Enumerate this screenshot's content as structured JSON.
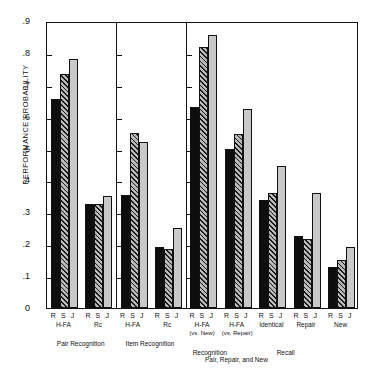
{
  "chart_data": {
    "type": "bar",
    "title": "",
    "xlabel": "Pair, Repair, and New",
    "ylabel": "PERFORMANCE PROBABILITY",
    "ylim": [
      0,
      0.9
    ],
    "yticks": [
      "0",
      ".1",
      ".2",
      ".3",
      ".4",
      ".5",
      ".6",
      ".7",
      ".8",
      ".9"
    ],
    "grid": false,
    "legend": "none",
    "series": [
      {
        "name": "R",
        "fill": "black"
      },
      {
        "name": "S",
        "fill": "hatched"
      },
      {
        "name": "J",
        "fill": "gray"
      }
    ],
    "panels": [
      {
        "title": "Pair Recognition",
        "groups": [
          {
            "label": "R S J",
            "sub1": "H-FA",
            "sub2": "",
            "values": [
              0.655,
              0.735,
              0.78
            ]
          },
          {
            "label": "R S J",
            "sub1": "Rc",
            "sub2": "",
            "values": [
              0.325,
              0.325,
              0.35
            ]
          }
        ]
      },
      {
        "title": "Item Recognition",
        "groups": [
          {
            "label": "R S J",
            "sub1": "H-FA",
            "sub2": "",
            "values": [
              0.355,
              0.55,
              0.52
            ]
          },
          {
            "label": "R S J",
            "sub1": "Rc",
            "sub2": "",
            "values": [
              0.19,
              0.185,
              0.25
            ]
          }
        ]
      },
      {
        "title": "Recognition",
        "title2": "Recall",
        "groups": [
          {
            "label": "R S J",
            "sub1": "H-FA",
            "sub2": "(vs. New)",
            "values": [
              0.63,
              0.82,
              0.855
            ]
          },
          {
            "label": "R S J",
            "sub1": "H-FA",
            "sub2": "(vs. Repair)",
            "values": [
              0.5,
              0.545,
              0.625
            ]
          },
          {
            "label": "R S J",
            "sub1": "Identical",
            "sub2": "",
            "values": [
              0.34,
              0.36,
              0.445
            ]
          },
          {
            "label": "R S J",
            "sub1": "Repair",
            "sub2": "",
            "values": [
              0.225,
              0.215,
              0.36
            ]
          },
          {
            "label": "R S J",
            "sub1": "New",
            "sub2": "",
            "values": [
              0.13,
              0.15,
              0.19
            ]
          }
        ]
      }
    ]
  },
  "axis": {
    "ylabel": "PERFORMANCE PROBABILITY",
    "xlabel": "Pair, Repair, and New"
  }
}
